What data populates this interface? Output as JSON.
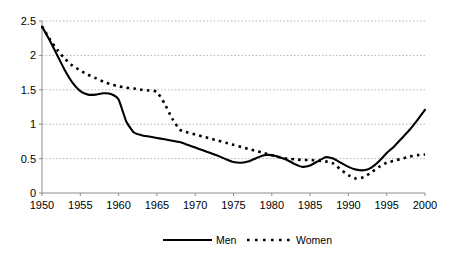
{
  "chart_data": {
    "type": "line",
    "title": "",
    "subtitle": "",
    "xlabel": "",
    "ylabel": "",
    "xlim": [
      1950,
      2000
    ],
    "ylim": [
      0,
      2.5
    ],
    "grid": true,
    "grid_orientation": "horizontal",
    "legend_position": "bottom-center",
    "x_ticks": [
      1950,
      1955,
      1960,
      1965,
      1970,
      1975,
      1980,
      1985,
      1990,
      1995,
      2000
    ],
    "x_tick_labels": [
      "1950",
      "1955",
      "1960",
      "1965",
      "1970",
      "1975",
      "1980",
      "1985",
      "1990",
      "1995",
      "2000"
    ],
    "y_ticks": [
      0,
      0.5,
      1,
      1.5,
      2,
      2.5
    ],
    "y_tick_labels": [
      "0",
      "0.5",
      "1",
      "1.5",
      "2",
      "2.5"
    ],
    "x": [
      1950,
      1951,
      1952,
      1953,
      1954,
      1955,
      1956,
      1957,
      1958,
      1959,
      1960,
      1961,
      1962,
      1963,
      1964,
      1965,
      1966,
      1967,
      1968,
      1969,
      1970,
      1971,
      1972,
      1973,
      1974,
      1975,
      1976,
      1977,
      1978,
      1979,
      1980,
      1981,
      1982,
      1983,
      1984,
      1985,
      1986,
      1987,
      1988,
      1989,
      1990,
      1991,
      1992,
      1993,
      1994,
      1995,
      1996,
      1997,
      1998,
      1999,
      2000
    ],
    "series": [
      {
        "name": "Men",
        "style": "solid",
        "color": "#000000",
        "values": [
          2.42,
          2.22,
          2.0,
          1.78,
          1.6,
          1.48,
          1.43,
          1.43,
          1.45,
          1.44,
          1.36,
          1.04,
          0.88,
          0.84,
          0.82,
          0.8,
          0.78,
          0.76,
          0.74,
          0.7,
          0.66,
          0.62,
          0.58,
          0.54,
          0.49,
          0.45,
          0.44,
          0.46,
          0.51,
          0.55,
          0.55,
          0.52,
          0.48,
          0.42,
          0.38,
          0.4,
          0.46,
          0.52,
          0.5,
          0.44,
          0.38,
          0.34,
          0.33,
          0.37,
          0.46,
          0.58,
          0.68,
          0.8,
          0.92,
          1.06,
          1.21
        ]
      },
      {
        "name": "Women",
        "style": "dotted",
        "color": "#000000",
        "values": [
          2.42,
          2.24,
          2.08,
          1.95,
          1.85,
          1.78,
          1.72,
          1.67,
          1.62,
          1.58,
          1.55,
          1.53,
          1.52,
          1.5,
          1.49,
          1.47,
          1.3,
          1.08,
          0.92,
          0.88,
          0.85,
          0.82,
          0.79,
          0.76,
          0.73,
          0.7,
          0.67,
          0.64,
          0.61,
          0.58,
          0.55,
          0.52,
          0.5,
          0.49,
          0.48,
          0.48,
          0.47,
          0.46,
          0.43,
          0.34,
          0.26,
          0.21,
          0.23,
          0.3,
          0.38,
          0.44,
          0.47,
          0.5,
          0.53,
          0.55,
          0.56
        ]
      }
    ],
    "legend": [
      {
        "label": "Men",
        "style": "solid"
      },
      {
        "label": "Women",
        "style": "dotted"
      }
    ]
  },
  "axes": {
    "y_labels": [
      "2.5",
      "2",
      "1.5",
      "1",
      "0.5",
      "0"
    ],
    "x_labels": [
      "1950",
      "1955",
      "1960",
      "1965",
      "1970",
      "1975",
      "1980",
      "1985",
      "1990",
      "1995",
      "2000"
    ]
  },
  "legend": {
    "men_label": "Men",
    "women_label": "Women"
  },
  "colors": {
    "line": "#000000",
    "grid": "#9a9a9a",
    "axis": "#8c8c8c",
    "background": "#ffffff"
  }
}
